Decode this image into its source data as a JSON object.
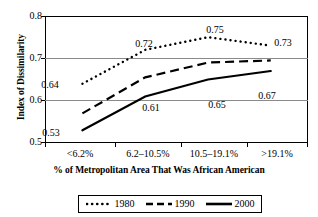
{
  "chart_data": {
    "type": "line",
    "title": "",
    "xlabel": "% of Metropolitan Area That Was African American",
    "ylabel": "Index of Dissimilarity",
    "categories": [
      "<6.2%",
      "6.2–10.5%",
      "10.5–19.1%",
      ">19.1%"
    ],
    "ylim": [
      0.5,
      0.8
    ],
    "yticks": [
      "0.5",
      "0.6",
      "0.7",
      "0.8"
    ],
    "ytick_values": [
      0.5,
      0.6,
      0.7,
      0.8
    ],
    "grid": "horizontal",
    "legend_position": "bottom-center",
    "series": [
      {
        "name": "1980",
        "style": "dotted",
        "color": "#000000",
        "values": [
          0.64,
          0.72,
          0.75,
          0.73
        ],
        "labels": [
          "0.64",
          "0.72",
          "0.75",
          "0.73"
        ]
      },
      {
        "name": "1990",
        "style": "dashed",
        "color": "#000000",
        "values": [
          0.57,
          0.655,
          0.69,
          0.695
        ],
        "labels": [
          "",
          "",
          "",
          ""
        ]
      },
      {
        "name": "2000",
        "style": "solid",
        "color": "#000000",
        "values": [
          0.53,
          0.61,
          0.65,
          0.67
        ],
        "labels": [
          "0.53",
          "0.61",
          "0.65",
          "0.67"
        ]
      }
    ]
  },
  "axes": {
    "y_title": "Index of Dissimilarity",
    "x_title": "% of Metropolitan Area That Was African American",
    "y_tick_0": "0.5",
    "y_tick_1": "0.6",
    "y_tick_2": "0.7",
    "y_tick_3": "0.8",
    "x_tick_0": "<6.2%",
    "x_tick_1": "6.2–10.5%",
    "x_tick_2": "10.5–19.1%",
    "x_tick_3": ">19.1%"
  },
  "legend": {
    "items": [
      {
        "label": "1980",
        "style": "dotted"
      },
      {
        "label": "1990",
        "style": "dashed"
      },
      {
        "label": "2000",
        "style": "solid"
      }
    ]
  },
  "point_labels": {
    "s1980_c0": "0.64",
    "s1980_c1": "0.72",
    "s1980_c2": "0.75",
    "s1980_c3": "0.73",
    "s2000_c0": "0.53",
    "s2000_c1": "0.61",
    "s2000_c2": "0.65",
    "s2000_c3": "0.67"
  }
}
